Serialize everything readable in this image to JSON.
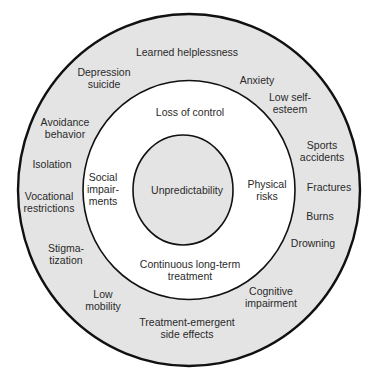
{
  "diagram": {
    "type": "concentric-circles",
    "colors": {
      "background": "#ffffff",
      "outer_ring_fill": "#e4e4e4",
      "middle_ring_fill": "#ffffff",
      "inner_circle_fill": "#e4e4e4",
      "stroke": "#111111",
      "text": "#2a2a2a"
    },
    "inner": {
      "label": "Unpredictability"
    },
    "middle": {
      "labels": [
        {
          "id": "loss-of-control",
          "text": "Loss of control"
        },
        {
          "id": "social-impairments",
          "text": "Social\nimpair-\nments"
        },
        {
          "id": "physical-risks",
          "text": "Physical\nrisks"
        },
        {
          "id": "continuous-treatment",
          "text": "Continuous long-term\ntreatment"
        }
      ]
    },
    "outer": {
      "labels": [
        {
          "id": "learned-helplessness",
          "text": "Learned helplessness"
        },
        {
          "id": "anxiety",
          "text": "Anxiety"
        },
        {
          "id": "low-self-esteem",
          "text": "Low self-\nesteem"
        },
        {
          "id": "sports-accidents",
          "text": "Sports\naccidents"
        },
        {
          "id": "fractures",
          "text": "Fractures"
        },
        {
          "id": "burns",
          "text": "Burns"
        },
        {
          "id": "drowning",
          "text": "Drowning"
        },
        {
          "id": "cognitive-impairment",
          "text": "Cognitive\nimpairment"
        },
        {
          "id": "treatment-side-effects",
          "text": "Treatment-emergent\nside effects"
        },
        {
          "id": "low-mobility",
          "text": "Low\nmobility"
        },
        {
          "id": "stigmatization",
          "text": "Stigma-\ntization"
        },
        {
          "id": "vocational-restrictions",
          "text": "Vocational\nrestrictions"
        },
        {
          "id": "isolation",
          "text": "Isolation"
        },
        {
          "id": "avoidance-behavior",
          "text": "Avoidance\nbehavior"
        },
        {
          "id": "depression-suicide",
          "text": "Depression\nsuicide"
        }
      ]
    }
  }
}
